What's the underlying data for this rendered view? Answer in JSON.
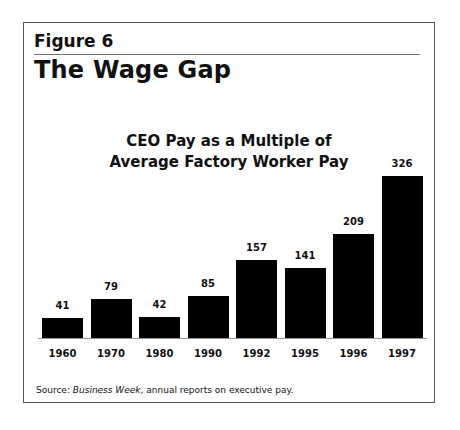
{
  "figure": {
    "label": "Figure 6",
    "title": "The Wage Gap",
    "source_prefix": "Source: ",
    "source_italic": "Business Week",
    "source_rest": ", annual reports on executive pay."
  },
  "chart_data": {
    "type": "bar",
    "title": "CEO Pay as a Multiple of Average Factory Worker Pay",
    "title_lines": [
      "CEO Pay as a Multiple of",
      "Average Factory Worker Pay"
    ],
    "categories": [
      "1960",
      "1970",
      "1980",
      "1990",
      "1992",
      "1995",
      "1996",
      "1997"
    ],
    "values": [
      41,
      79,
      42,
      85,
      157,
      141,
      209,
      326
    ],
    "xlabel": "",
    "ylabel": "",
    "ylim": [
      0,
      326
    ],
    "grid": false,
    "legend": null,
    "data_labels": true,
    "bar_color": "#000000"
  }
}
